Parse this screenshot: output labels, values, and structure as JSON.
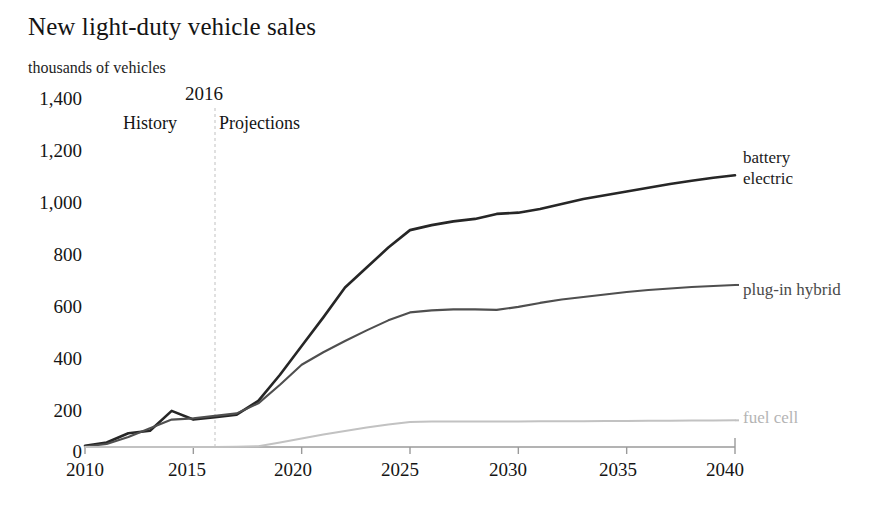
{
  "chart_data": {
    "type": "line",
    "title": "New light-duty vehicle sales",
    "subtitle": "thousands of vehicles",
    "xlabel": "",
    "ylabel": "thousands of vehicles",
    "xlim": [
      2010,
      2040
    ],
    "ylim": [
      0,
      1400
    ],
    "ytick_labels": [
      "1,400",
      "1,200",
      "1,000",
      "800",
      "600",
      "400",
      "200",
      "0"
    ],
    "ytick_values": [
      1400,
      1200,
      1000,
      800,
      600,
      400,
      200,
      0
    ],
    "xtick_labels": [
      "2010",
      "2015",
      "2020",
      "2025",
      "2030",
      "2035",
      "2040"
    ],
    "xtick_values": [
      2010,
      2015,
      2020,
      2025,
      2030,
      2035,
      2040
    ],
    "grid": false,
    "legend_position": "right-inline",
    "divider": {
      "year": 2016,
      "year_label": "2016",
      "history_label": "History",
      "projections_label": "Projections",
      "style": "dashed-vertical"
    },
    "x": [
      2010,
      2011,
      2012,
      2013,
      2014,
      2015,
      2016,
      2017,
      2018,
      2019,
      2020,
      2021,
      2022,
      2023,
      2024,
      2025,
      2026,
      2027,
      2028,
      2029,
      2030,
      2031,
      2032,
      2033,
      2034,
      2035,
      2036,
      2037,
      2038,
      2039,
      2040
    ],
    "series": [
      {
        "name": "battery electric",
        "color": "#262626",
        "values": [
          5,
          18,
          55,
          65,
          145,
          110,
          120,
          130,
          185,
          290,
          405,
          520,
          640,
          720,
          800,
          870,
          890,
          905,
          915,
          935,
          940,
          955,
          975,
          995,
          1010,
          1025,
          1040,
          1055,
          1068,
          1080,
          1090
        ]
      },
      {
        "name": "plug-in hybrid",
        "color": "#4f4f4f",
        "values": [
          2,
          12,
          40,
          75,
          110,
          115,
          125,
          135,
          175,
          250,
          330,
          380,
          425,
          468,
          508,
          540,
          548,
          552,
          552,
          550,
          562,
          578,
          592,
          602,
          612,
          622,
          630,
          636,
          642,
          646,
          650
        ]
      },
      {
        "name": "fuel cell",
        "color": "#c2c2c2",
        "values": [
          0,
          0,
          0,
          0,
          0,
          0,
          0,
          1,
          3,
          18,
          34,
          50,
          64,
          78,
          90,
          100,
          102,
          102,
          102,
          102,
          102,
          103,
          103,
          103,
          104,
          104,
          105,
          105,
          106,
          106,
          107
        ]
      }
    ]
  },
  "axis_labels": {
    "y": [
      "1,400",
      "1,200",
      "1,000",
      "800",
      "600",
      "400",
      "200",
      "0"
    ],
    "x": [
      "2010",
      "2015",
      "2020",
      "2025",
      "2030",
      "2035",
      "2040"
    ]
  },
  "series_labels": {
    "battery_line1": "battery",
    "battery_line2": "electric",
    "phev": "plug-in hybrid",
    "fuelcell": "fuel cell"
  },
  "colors": {
    "battery": "#262626",
    "phev": "#4f4f4f",
    "fuelcell": "#c2c2c2",
    "axis": "#9a9a9a",
    "divider": "#cccccc",
    "text": "#151515",
    "background": "#ffffff"
  }
}
